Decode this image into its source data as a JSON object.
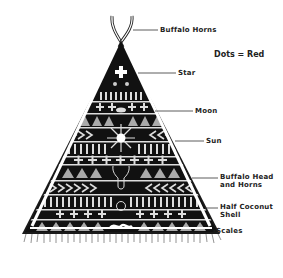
{
  "diagram": {
    "legend": "Dots = Red",
    "labels": [
      {
        "id": "buffalo-horns",
        "text": "Buffalo Horns",
        "x": 160,
        "y": 26,
        "line_x1": 133,
        "line_x2": 158,
        "line_y": 30
      },
      {
        "id": "star",
        "text": "Star",
        "x": 178,
        "y": 69,
        "line_x1": 138,
        "line_x2": 176,
        "line_y": 73
      },
      {
        "id": "moon",
        "text": "Moon",
        "x": 195,
        "y": 107,
        "line_x1": 155,
        "line_x2": 193,
        "line_y": 111
      },
      {
        "id": "sun",
        "text": "Sun",
        "x": 206,
        "y": 137,
        "line_x1": 175,
        "line_x2": 204,
        "line_y": 141
      },
      {
        "id": "buffalo-head",
        "text": "Buffalo Head",
        "line2": "and Horns",
        "x": 220,
        "y": 173,
        "line_x1": 192,
        "line_x2": 218,
        "line_y": 178
      },
      {
        "id": "half-coconut",
        "text": "Half Coconut",
        "line2": "Shell",
        "x": 220,
        "y": 203,
        "line_x1": 205,
        "line_x2": 218,
        "line_y": 208
      },
      {
        "id": "scales",
        "text": "-Scales",
        "x": 213,
        "y": 227
      }
    ]
  }
}
